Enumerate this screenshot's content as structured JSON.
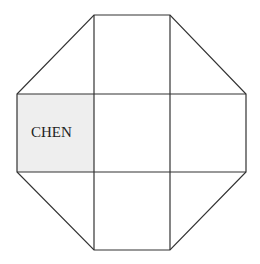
{
  "diagram": {
    "type": "octagon-grid",
    "colors": {
      "line": "#333333",
      "highlight_fill": "#eeeeee",
      "background": "#ffffff"
    },
    "grid": {
      "x": [
        17,
        94,
        170,
        246
      ],
      "y": [
        15,
        94,
        172,
        250
      ]
    },
    "cells": [
      {
        "row": 0,
        "col": 0,
        "shape": "triangle",
        "label": ""
      },
      {
        "row": 0,
        "col": 1,
        "shape": "square",
        "label": ""
      },
      {
        "row": 0,
        "col": 2,
        "shape": "triangle",
        "label": ""
      },
      {
        "row": 1,
        "col": 0,
        "shape": "square",
        "label": "CHEN",
        "highlighted": true
      },
      {
        "row": 1,
        "col": 1,
        "shape": "square",
        "label": ""
      },
      {
        "row": 1,
        "col": 2,
        "shape": "square",
        "label": ""
      },
      {
        "row": 2,
        "col": 0,
        "shape": "triangle",
        "label": ""
      },
      {
        "row": 2,
        "col": 1,
        "shape": "square",
        "label": ""
      },
      {
        "row": 2,
        "col": 2,
        "shape": "triangle",
        "label": ""
      }
    ],
    "highlight_label": "CHEN"
  }
}
